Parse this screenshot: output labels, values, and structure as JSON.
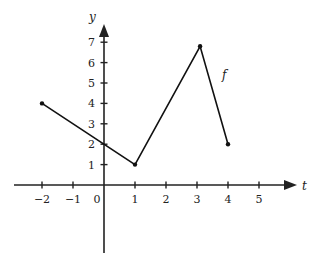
{
  "chart_data": {
    "type": "line",
    "title": "",
    "xlabel": "t",
    "ylabel": "y",
    "series": [
      {
        "name": "f",
        "points": [
          [
            -2,
            4
          ],
          [
            1,
            1
          ],
          [
            3.1,
            6.8
          ],
          [
            4,
            2
          ]
        ]
      }
    ],
    "x_ticks": [
      -2,
      -1,
      0,
      1,
      2,
      3,
      4,
      5
    ],
    "x_tick_labels": [
      "−2",
      "−1",
      "0",
      "1",
      "2",
      "3",
      "4",
      "5"
    ],
    "y_ticks": [
      1,
      2,
      3,
      4,
      5,
      6,
      7
    ],
    "y_tick_labels": [
      "1",
      "2",
      "3",
      "4",
      "5",
      "6",
      "7"
    ],
    "xlim": [
      -2.9,
      6.2
    ],
    "ylim": [
      -3.3,
      7.8
    ],
    "grid": false,
    "legend": "none",
    "annotations": [
      {
        "text": "f",
        "x": 3.9,
        "y": 5.4
      }
    ],
    "colors": {
      "line": "#111111",
      "axis": "#222222"
    }
  }
}
